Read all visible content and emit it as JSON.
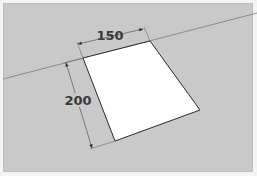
{
  "diagram": {
    "type": "3d-rectangle-with-dimensions",
    "background_color": "#c9c9c9",
    "face_color": "#ffffff",
    "edge_color": "#2a2a2a",
    "horizon_line": {
      "x1": 3,
      "y1": 79,
      "x2": 257,
      "y2": 13,
      "color": "#7a7a7a"
    },
    "face": {
      "points": [
        [
          83,
          58
        ],
        [
          150,
          41
        ],
        [
          200,
          110
        ],
        [
          115,
          141
        ]
      ]
    },
    "dimensions": [
      {
        "id": "width",
        "label": "150",
        "value": 150,
        "line": {
          "x1": 78,
          "y1": 44,
          "x2": 143,
          "y2": 29
        },
        "label_pos": {
          "x": 110,
          "y": 40
        }
      },
      {
        "id": "height",
        "label": "200",
        "value": 200,
        "line": {
          "x1": 66,
          "y1": 63,
          "x2": 92,
          "y2": 148
        },
        "label_pos": {
          "x": 78,
          "y": 104
        }
      }
    ]
  }
}
